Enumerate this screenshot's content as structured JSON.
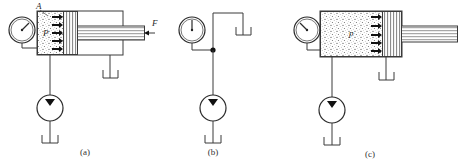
{
  "figure": {
    "type": "engineering-schematic",
    "background_color": "#ffffff",
    "line_color": "#3a3a3a",
    "panels": [
      {
        "id": "a",
        "caption": "(a)",
        "labels": {
          "area_label": "A",
          "pressure_label": "P",
          "force_label": "F"
        },
        "gauge": {
          "name": "pressure-gauge",
          "needle_direction": "up-right",
          "needle_angle_deg": -45
        },
        "cylinder": {
          "chamber_fill": "stippled",
          "piston_fill": "hatched",
          "piston_position": "retracted-left",
          "rod_extended": true,
          "pressure_arrows": 5,
          "pressure_arrow_direction": "right"
        },
        "pump": {
          "name": "hydraulic-pump",
          "symbol": "circle-with-filled-triangle"
        },
        "reservoirs": 2
      },
      {
        "id": "b",
        "caption": "(b)",
        "labels": {},
        "gauge": {
          "name": "pressure-gauge",
          "needle_direction": "up",
          "needle_angle_deg": 0
        },
        "cylinder": null,
        "junction": {
          "name": "line-junction-dot"
        },
        "pump": {
          "name": "hydraulic-pump",
          "symbol": "circle-with-filled-triangle"
        },
        "reservoirs": 2
      },
      {
        "id": "c",
        "caption": "(c)",
        "labels": {
          "pressure_label": "p"
        },
        "gauge": {
          "name": "pressure-gauge",
          "needle_direction": "up-left",
          "needle_angle_deg": 45
        },
        "cylinder": {
          "chamber_fill": "stippled",
          "piston_fill": "hatched",
          "piston_position": "extended-right",
          "rod_extended": true,
          "pressure_arrows": 5,
          "pressure_arrow_direction": "right"
        },
        "pump": {
          "name": "hydraulic-pump",
          "symbol": "circle-with-filled-triangle"
        },
        "reservoirs": 2
      }
    ]
  }
}
